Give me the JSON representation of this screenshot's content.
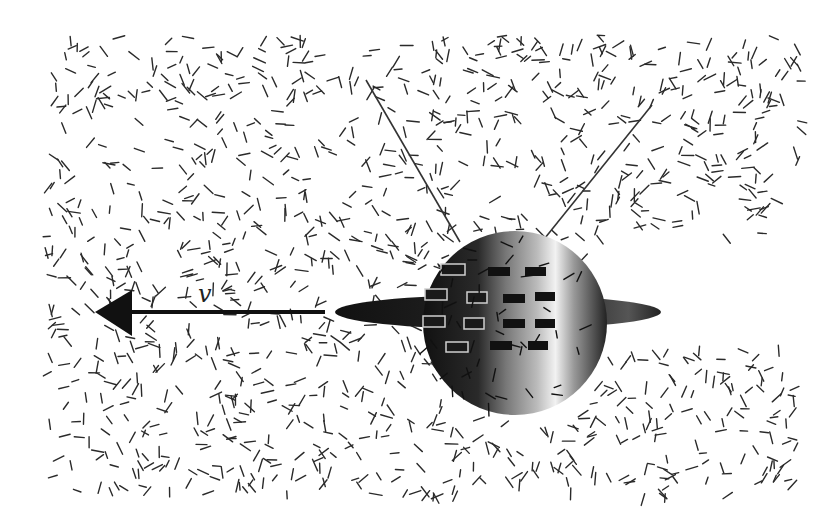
{
  "figure": {
    "velocity_label": "v",
    "colors": {
      "background": "#ffffff",
      "dash": "#2a2a2a",
      "arrow": "#111111",
      "sphere_dark": "#1a1a1a",
      "sphere_light": "#e8e8e8"
    },
    "field": {
      "x_range": [
        45,
        800
      ],
      "y_range": [
        35,
        495
      ],
      "wake": {
        "x_start": 600,
        "y_top": 235,
        "y_bottom": 345
      },
      "dash_count": 1400,
      "dash_length": 10
    },
    "arrow": {
      "x_tail": 325,
      "x_head": 95,
      "y": 312
    },
    "sphere": {
      "cx": 515,
      "cy": 323,
      "r": 92
    },
    "ring": {
      "cx": 498,
      "cy": 312,
      "rx": 163,
      "ry": 17
    },
    "antennas": [
      {
        "x1": 460,
        "y1": 242,
        "x2": 366,
        "y2": 80
      },
      {
        "x1": 545,
        "y1": 238,
        "x2": 652,
        "y2": 105
      }
    ],
    "panels_outline": [
      [
        441,
        264,
        24,
        11
      ],
      [
        425,
        289,
        22,
        11
      ],
      [
        467,
        292,
        20,
        11
      ],
      [
        423,
        316,
        22,
        11
      ],
      [
        464,
        318,
        20,
        11
      ],
      [
        446,
        342,
        22,
        10
      ]
    ],
    "panels_filled": [
      [
        488,
        267,
        22,
        9
      ],
      [
        525,
        267,
        21,
        9
      ],
      [
        503,
        294,
        22,
        9
      ],
      [
        535,
        292,
        20,
        9
      ],
      [
        503,
        319,
        22,
        9
      ],
      [
        535,
        319,
        20,
        9
      ],
      [
        490,
        341,
        22,
        9
      ],
      [
        528,
        341,
        20,
        9
      ]
    ]
  }
}
